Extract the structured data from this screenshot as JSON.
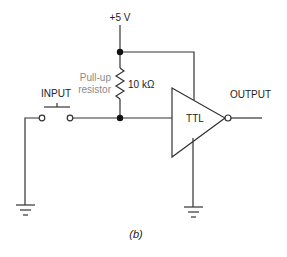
{
  "diagram": {
    "supply_label": "+5 V",
    "resistor": {
      "name_line1": "Pull-up",
      "name_line2": "resistor",
      "value": "10 kΩ"
    },
    "input_label": "INPUT",
    "gate_label": "TTL",
    "output_label": "OUTPUT",
    "caption": "(b)",
    "colors": {
      "wire": "#333333",
      "label": "#222222",
      "annotation": "#8a8a8a"
    }
  }
}
